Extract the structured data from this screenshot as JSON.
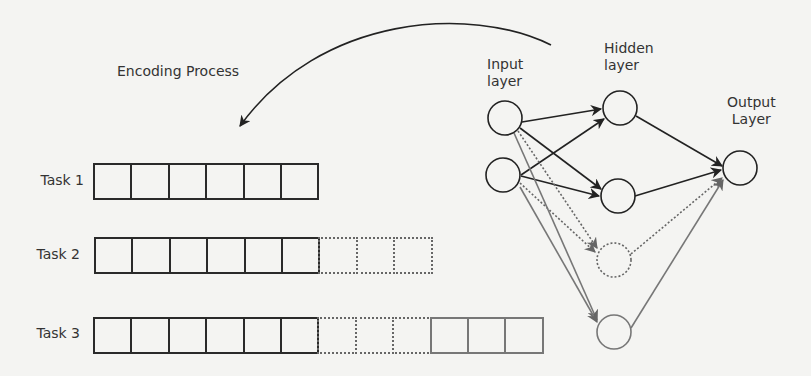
{
  "title": "Encoding Process",
  "layers": {
    "input": "Input\nlayer",
    "input_lines": [
      "Input",
      "layer"
    ],
    "hidden_lines": [
      "Hidden",
      "layer"
    ],
    "output_lines": [
      "Output",
      "Layer"
    ]
  },
  "tasks": [
    {
      "label": "Task 1",
      "cells": [
        "solid",
        "solid",
        "solid",
        "solid",
        "solid",
        "solid"
      ]
    },
    {
      "label": "Task 2",
      "cells": [
        "solid",
        "solid",
        "solid",
        "solid",
        "solid",
        "solid",
        "dotted",
        "dotted",
        "dotted"
      ]
    },
    {
      "label": "Task 3",
      "cells": [
        "solid",
        "solid",
        "solid",
        "solid",
        "solid",
        "solid",
        "dotted",
        "dotted",
        "dotted",
        "gray",
        "gray",
        "gray"
      ]
    }
  ],
  "network": {
    "nodes": {
      "input": [
        {
          "id": "in1",
          "style": "solid"
        },
        {
          "id": "in2",
          "style": "solid"
        }
      ],
      "hidden": [
        {
          "id": "h1",
          "style": "solid"
        },
        {
          "id": "h2",
          "style": "solid"
        },
        {
          "id": "h3",
          "style": "dotted"
        },
        {
          "id": "h4",
          "style": "gray"
        }
      ],
      "output": [
        {
          "id": "out",
          "style": "solid"
        }
      ]
    },
    "colors": {
      "solid": "#222222",
      "dotted": "#666666",
      "gray": "#777777"
    }
  }
}
